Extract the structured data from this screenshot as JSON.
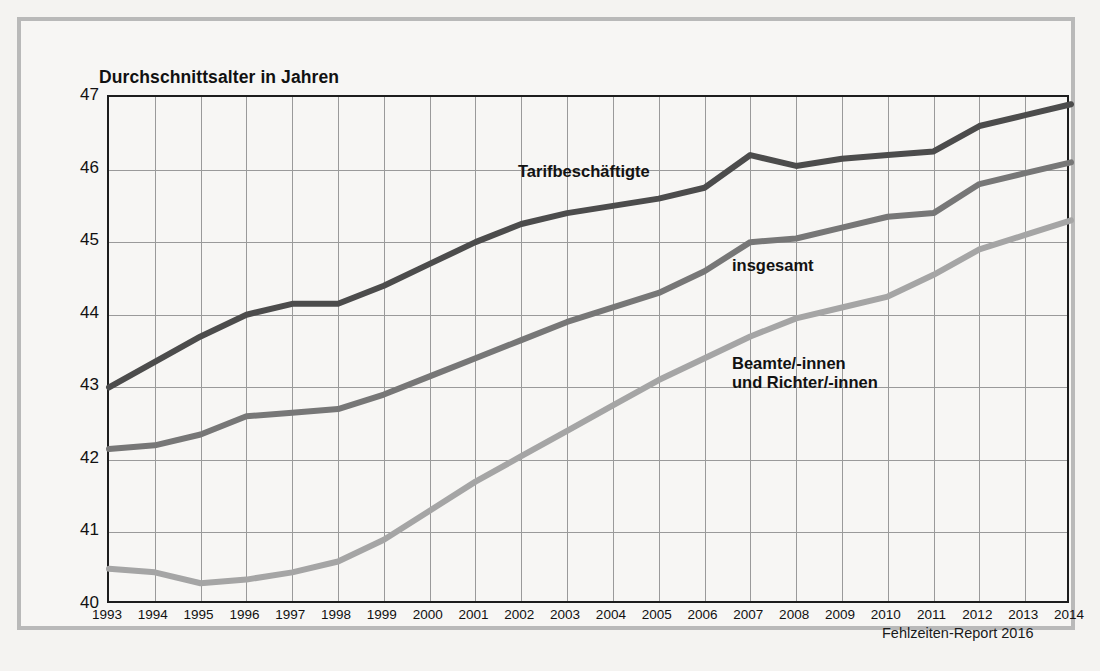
{
  "figure": {
    "title": "Durchschnittsalter in Jahren",
    "source_note": "Fehlzeiten-Report 2016",
    "frame_color": "#b9b9b9",
    "background_color": "#f4f3f1"
  },
  "series_labels": {
    "tarifbeschaeftigte": "Tarifbeschäftigte",
    "insgesamt": "insgesamt",
    "beamte_line1": "Beamte/-innen",
    "beamte_line2": "und Richter/-innen"
  },
  "chart_data": {
    "type": "line",
    "title": "Durchschnittsalter in Jahren",
    "xlabel": "",
    "ylabel": "Durchschnittsalter in Jahren",
    "ylim": [
      40,
      47
    ],
    "xlim": [
      1993,
      2014
    ],
    "yticks": [
      40,
      41,
      42,
      43,
      44,
      45,
      46,
      47
    ],
    "ytick_labels": [
      "40",
      "41",
      "42",
      "43",
      "44",
      "45",
      "46",
      "47"
    ],
    "grid": true,
    "legend_position": "inline-annotations",
    "x": [
      1993,
      1994,
      1995,
      1996,
      1997,
      1998,
      1999,
      2000,
      2001,
      2002,
      2003,
      2004,
      2005,
      2006,
      2007,
      2008,
      2009,
      2010,
      2011,
      2012,
      2013,
      2014
    ],
    "xtick_labels": [
      "1993",
      "1994",
      "1995",
      "1996",
      "1997",
      "1998",
      "1999",
      "2000",
      "2001",
      "2002",
      "2003",
      "2004",
      "2005",
      "2006",
      "2007",
      "2008",
      "2009",
      "2010",
      "2011",
      "2012",
      "2013",
      "2014"
    ],
    "series": [
      {
        "name": "Tarifbeschäftigte",
        "color": "#4c4c4c",
        "values": [
          43.0,
          43.35,
          43.7,
          44.0,
          44.15,
          44.15,
          44.4,
          44.7,
          45.0,
          45.25,
          45.4,
          45.5,
          45.6,
          45.75,
          46.2,
          46.05,
          46.15,
          46.2,
          46.25,
          46.6,
          46.75,
          46.9
        ]
      },
      {
        "name": "insgesamt",
        "color": "#777777",
        "values": [
          42.15,
          42.2,
          42.35,
          42.6,
          42.65,
          42.7,
          42.9,
          43.15,
          43.4,
          43.65,
          43.9,
          44.1,
          44.3,
          44.6,
          45.0,
          45.05,
          45.2,
          45.35,
          45.4,
          45.8,
          45.95,
          46.1
        ]
      },
      {
        "name": "Beamte/-innen und Richter/-innen",
        "color": "#a5a5a5",
        "values": [
          40.5,
          40.45,
          40.3,
          40.35,
          40.45,
          40.6,
          40.9,
          41.3,
          41.7,
          42.05,
          42.4,
          42.75,
          43.1,
          43.4,
          43.7,
          43.95,
          44.1,
          44.25,
          44.55,
          44.9,
          45.1,
          45.3
        ]
      }
    ]
  }
}
